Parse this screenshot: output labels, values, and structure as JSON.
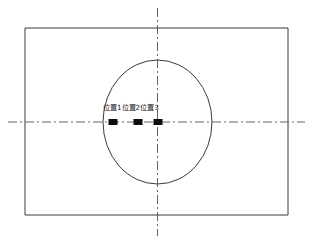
{
  "diagram": {
    "type": "engineering-layout-diagram",
    "canvas": {
      "width": 312,
      "height": 243,
      "background": "#ffffff"
    },
    "stroke_color": "#3a3a3a",
    "centerline_color": "#555555",
    "marker_color": "#0d0d0d",
    "outer_rectangle": {
      "name": "outer-plate-boundary",
      "x": 25,
      "y": 28,
      "width": 263,
      "height": 187,
      "stroke_width": 1
    },
    "ellipse": {
      "name": "circular-opening",
      "center_x": 157.5,
      "center_y": 122,
      "radius_x": 54.5,
      "radius_y": 62,
      "stroke_width": 1
    },
    "centerlines": {
      "vertical": {
        "x": 157.5,
        "y1": 8,
        "y2": 236
      },
      "horizontal": {
        "y": 122,
        "x1": 8,
        "x2": 305
      },
      "dash_pattern": "9 3 2 3"
    },
    "markers": [
      {
        "label": "位置1",
        "x": 113,
        "y": 122,
        "width": 9,
        "height": 6
      },
      {
        "label": "位置2",
        "x": 138,
        "y": 122,
        "width": 9,
        "height": 6
      },
      {
        "label": "位置3",
        "x": 158,
        "y": 122,
        "width": 9,
        "height": 6
      }
    ],
    "label_text": {
      "position_1": "位置1",
      "position_2": "位置2",
      "position_3": "位置3"
    }
  }
}
